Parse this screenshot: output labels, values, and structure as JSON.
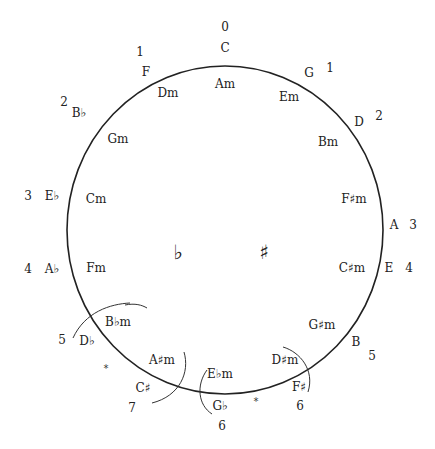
{
  "diagram": {
    "center_symbols": {
      "flat": "♭",
      "sharp": "♯"
    },
    "major_keys": [
      {
        "key": "C",
        "count": "0",
        "kx": 225,
        "ky": 52,
        "nx": 225,
        "ny": 31
      },
      {
        "key": "G",
        "count": "1",
        "kx": 309,
        "ky": 77,
        "nx": 330,
        "ny": 72
      },
      {
        "key": "D",
        "count": "2",
        "kx": 359,
        "ky": 126,
        "nx": 379,
        "ny": 120
      },
      {
        "key": "A",
        "count": "3",
        "kx": 394,
        "ky": 229,
        "nx": 413,
        "ny": 229
      },
      {
        "key": "E",
        "count": "4",
        "kx": 389,
        "ky": 272,
        "nx": 409,
        "ny": 272
      },
      {
        "key": "B",
        "count": "5",
        "kx": 356,
        "ky": 346,
        "nx": 372,
        "ny": 360
      },
      {
        "key": "F♯",
        "count": "6",
        "kx": 299,
        "ky": 391,
        "nx": 300,
        "ny": 410
      },
      {
        "key": "G♭",
        "count": "6",
        "kx": 220,
        "ky": 410,
        "nx": 222,
        "ny": 430
      },
      {
        "key": "C♯",
        "count": "7",
        "kx": 143,
        "ky": 392,
        "nx": 132,
        "ny": 412
      },
      {
        "key": "D♭",
        "count": "5",
        "kx": 87,
        "ky": 345,
        "nx": 62,
        "ny": 344
      },
      {
        "key": "A♭",
        "count": "4",
        "kx": 52,
        "ky": 273,
        "nx": 28,
        "ny": 273
      },
      {
        "key": "E♭",
        "count": "3",
        "kx": 52,
        "ky": 200,
        "nx": 28,
        "ny": 200
      },
      {
        "key": "B♭",
        "count": "2",
        "kx": 79,
        "ky": 117,
        "nx": 64,
        "ny": 106
      },
      {
        "key": "F",
        "count": "1",
        "kx": 146,
        "ky": 76,
        "nx": 140,
        "ny": 56
      }
    ],
    "minor_keys": [
      {
        "key": "Am",
        "x": 225,
        "y": 88
      },
      {
        "key": "Em",
        "x": 289,
        "y": 101
      },
      {
        "key": "Bm",
        "x": 328,
        "y": 146
      },
      {
        "key": "F♯m",
        "x": 354,
        "y": 203
      },
      {
        "key": "C♯m",
        "x": 352,
        "y": 272
      },
      {
        "key": "G♯m",
        "x": 322,
        "y": 329
      },
      {
        "key": "D♯m",
        "x": 285,
        "y": 364
      },
      {
        "key": "E♭m",
        "x": 220,
        "y": 378
      },
      {
        "key": "A♯m",
        "x": 162,
        "y": 364
      },
      {
        "key": "B♭m",
        "x": 118,
        "y": 326
      },
      {
        "key": "Fm",
        "x": 96,
        "y": 272
      },
      {
        "key": "Cm",
        "x": 96,
        "y": 203
      },
      {
        "key": "Gm",
        "x": 118,
        "y": 143
      },
      {
        "key": "Dm",
        "x": 168,
        "y": 97
      }
    ],
    "enharmonic_markers": [
      {
        "symbol": "*",
        "x": 106,
        "y": 372
      },
      {
        "symbol": "*",
        "x": 256,
        "y": 405
      }
    ]
  }
}
